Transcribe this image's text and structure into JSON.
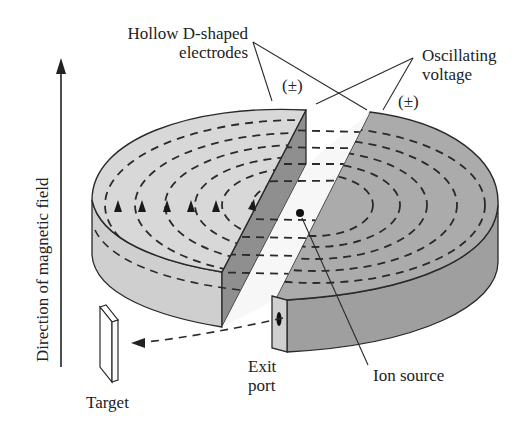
{
  "diagram": {
    "labels": {
      "electrodes_line1": "Hollow D-shaped",
      "electrodes_line2": "electrodes",
      "voltage_line1": "Oscillating",
      "voltage_line2": "voltage",
      "polarity_left": "(±)",
      "polarity_right": "(±)",
      "magnetic_field": "Direction of magnetic field",
      "exit_line1": "Exit",
      "exit_line2": "port",
      "ion_source": "Ion source",
      "target": "Target"
    },
    "components": [
      {
        "id": "left-dee",
        "name": "Hollow D-shaped electrode (left)"
      },
      {
        "id": "right-dee",
        "name": "Hollow D-shaped electrode (right)"
      },
      {
        "id": "ion-source",
        "name": "Ion source"
      },
      {
        "id": "exit-port",
        "name": "Exit port"
      },
      {
        "id": "target",
        "name": "Target"
      },
      {
        "id": "magnetic-field-arrow",
        "name": "Direction of magnetic field"
      }
    ],
    "spiral_orbits": 6,
    "colors": {
      "left_dee_top": "#d6d6d6",
      "left_dee_side": "#c9c9c9",
      "left_dee_inner_face": "#8f8f8f",
      "right_dee_top": "#a9a9a9",
      "right_dee_side": "#9d9d9d",
      "gap": "#f4f4f4",
      "outline": "#2a2a2a",
      "text": "#222222"
    }
  }
}
